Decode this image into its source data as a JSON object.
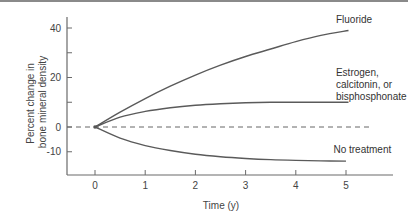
{
  "chart_data": {
    "type": "line",
    "title": "",
    "xlabel": "Time (y)",
    "ylabel": [
      "Percent change in",
      "bone mineral density"
    ],
    "xlim": [
      -0.5,
      5.9
    ],
    "ylim": [
      -19,
      44
    ],
    "x_ticks": [
      0,
      1,
      2,
      3,
      4,
      5
    ],
    "y_ticks": [
      40,
      30,
      20,
      10,
      0,
      -10
    ],
    "y_tick_labels": [
      "40",
      "",
      "20",
      "",
      "0",
      "-10"
    ],
    "grid": false,
    "reference_line": {
      "y": 0,
      "style": "dashed",
      "x_end": 5.5
    },
    "series": [
      {
        "name": "Fluoride",
        "label_lines": [
          "Fluoride"
        ],
        "x": [
          0,
          0.5,
          1,
          1.5,
          2,
          2.5,
          3,
          3.5,
          4,
          4.5,
          5.05
        ],
        "values": [
          0,
          6,
          11.5,
          16.5,
          21,
          25,
          28.5,
          31.5,
          34.5,
          37,
          39
        ],
        "label_pos": [
          4.8,
          42
        ]
      },
      {
        "name": "Estrogen, calcitonin, or bisphosphonate",
        "label_lines": [
          "Estrogen,",
          "calcitonin, or",
          "bisphosphonate"
        ],
        "x": [
          0,
          0.5,
          1,
          1.5,
          2,
          2.5,
          3,
          3.5,
          4,
          4.5,
          5.05
        ],
        "values": [
          0,
          4,
          6.3,
          7.8,
          8.8,
          9.4,
          9.8,
          10,
          10,
          10,
          10
        ],
        "label_pos": [
          4.8,
          20.5
        ]
      },
      {
        "name": "No treatment",
        "label_lines": [
          "No treatment"
        ],
        "x": [
          0,
          0.5,
          1,
          1.5,
          2,
          2.5,
          3,
          3.5,
          4,
          4.5,
          5
        ],
        "values": [
          0,
          -4.5,
          -7.5,
          -9.5,
          -11,
          -12,
          -12.7,
          -13.2,
          -13.5,
          -13.7,
          -13.8
        ],
        "label_pos": [
          4.75,
          -10.5
        ]
      }
    ]
  }
}
